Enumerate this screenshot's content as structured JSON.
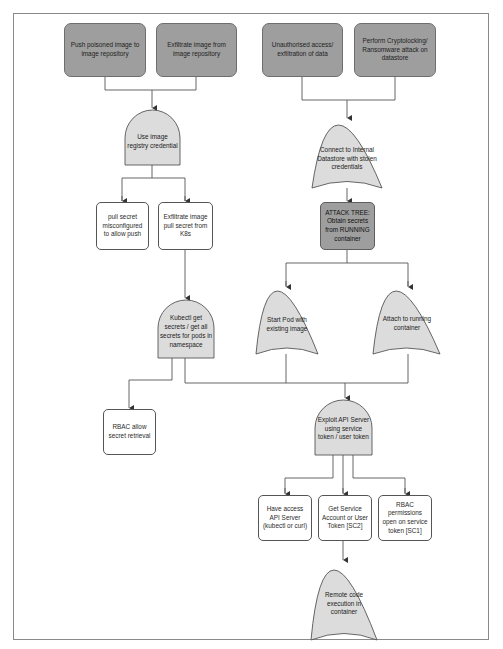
{
  "diagram": {
    "type": "attack tree",
    "colors": {
      "goal_fill": "#9e9e9e",
      "gate_fill": "#dcdcdc",
      "leaf_fill": "#ffffff",
      "line": "#555555",
      "frame": "#8a8a8a"
    },
    "goals": [
      {
        "id": "g1",
        "label": "Push poisoned image to image repository"
      },
      {
        "id": "g2",
        "label": "Exfiltrate image from image repository"
      },
      {
        "id": "g3",
        "label": "Unauthorised access/ exfiltration of data"
      },
      {
        "id": "g4",
        "label": "Perform Cryptolocking/ Ransomware attack on datastore"
      }
    ],
    "gates": [
      {
        "id": "and1",
        "type": "AND",
        "label": "Use image registry credential"
      },
      {
        "id": "or1",
        "type": "OR",
        "label": "Connect to Internal Datastore with stolen credentials"
      },
      {
        "id": "or2",
        "type": "OR",
        "label": "Start Pod with existing image"
      },
      {
        "id": "or3",
        "type": "OR",
        "label": "Attach to running container"
      },
      {
        "id": "and2",
        "type": "AND",
        "label": "Kubectl get secrets / get all secrets for pods in namespace"
      },
      {
        "id": "and3",
        "type": "AND",
        "label": "Exploit API Server using service token / user token"
      },
      {
        "id": "or4",
        "type": "OR",
        "label": "Remote code execution in container"
      }
    ],
    "subtree": {
      "id": "s1",
      "label": "ATTACK TREE: Obtain secrets from RUNNING container"
    },
    "leaves": [
      {
        "id": "l1",
        "label": "pull secret misconfigured to allow push"
      },
      {
        "id": "l2",
        "label": "Exfiltrate image pull secret from K8s"
      },
      {
        "id": "l3",
        "label": "RBAC allow secret retrieval"
      },
      {
        "id": "l4",
        "label": "Have access API Server (kubectl or curl)"
      },
      {
        "id": "l5",
        "label": "Get Service Account or User Token [SC2]"
      },
      {
        "id": "l6",
        "label": "RBAC permissions open on service token [SC1]"
      }
    ],
    "edges": [
      [
        "g1",
        "and1"
      ],
      [
        "g2",
        "and1"
      ],
      [
        "and1",
        "l1"
      ],
      [
        "and1",
        "l2"
      ],
      [
        "l2",
        "and2"
      ],
      [
        "g3",
        "or1"
      ],
      [
        "g4",
        "or1"
      ],
      [
        "or1",
        "s1"
      ],
      [
        "s1",
        "or2"
      ],
      [
        "s1",
        "or3"
      ],
      [
        "and2",
        "l3"
      ],
      [
        "and2",
        "and3"
      ],
      [
        "or2",
        "and3"
      ],
      [
        "or3",
        "and3"
      ],
      [
        "and3",
        "l4"
      ],
      [
        "and3",
        "l5"
      ],
      [
        "and3",
        "l6"
      ],
      [
        "l5",
        "or4"
      ]
    ]
  }
}
